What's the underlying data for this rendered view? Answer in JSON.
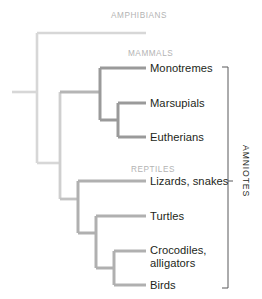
{
  "diagram": {
    "type": "cladogram",
    "title_visible": false,
    "colors": {
      "amphibian_branch": "#d7d7d7",
      "backbone_branch": "#c9c9c9",
      "mammal_branch": "#9a9a9a",
      "reptile_branch": "#b0b0b0",
      "group_label_color": "#b3b3b3",
      "tip_label_color": "#231f20",
      "bracket_color": "#58595b",
      "background": "#ffffff"
    },
    "group_labels": [
      {
        "name": "amphibians-group-label",
        "text": "AMPHIBIANS",
        "x": 111,
        "y": 11
      },
      {
        "name": "mammals-group-label",
        "text": "MAMMALS",
        "x": 128,
        "y": 49
      },
      {
        "name": "reptiles-group-label",
        "text": "REPTILES",
        "x": 131,
        "y": 165
      }
    ],
    "tips": [
      {
        "name": "tip-amphibians",
        "text": "",
        "x": 150,
        "y": 62,
        "branch_y": 33,
        "branch_x1": 37,
        "branch_x2": 146
      },
      {
        "name": "tip-monotremes",
        "text": "Monotremes",
        "x": 150,
        "y": 62,
        "branch_y": 68,
        "branch_x1": 100,
        "branch_x2": 146
      },
      {
        "name": "tip-marsupials",
        "text": "Marsupials",
        "x": 150,
        "y": 97,
        "branch_y": 103,
        "branch_x1": 118,
        "branch_x2": 146
      },
      {
        "name": "tip-eutherians",
        "text": "Eutherians",
        "x": 150,
        "y": 131,
        "branch_y": 137,
        "branch_x1": 118,
        "branch_x2": 146
      },
      {
        "name": "tip-lizards-snakes",
        "text": "Lizards, snakes",
        "x": 150,
        "y": 175,
        "branch_y": 181,
        "branch_x1": 78,
        "branch_x2": 146
      },
      {
        "name": "tip-turtles",
        "text": "Turtles",
        "x": 150,
        "y": 210,
        "branch_y": 216,
        "branch_x1": 96,
        "branch_x2": 146
      },
      {
        "name": "tip-crocodiles-alligators",
        "text": "Crocodiles,\nalligators",
        "x": 150,
        "y": 244,
        "branch_y": 251,
        "branch_x1": 114,
        "branch_x2": 146
      },
      {
        "name": "tip-birds",
        "text": "Birds",
        "x": 150,
        "y": 279,
        "branch_y": 285,
        "branch_x1": 114,
        "branch_x2": 146
      }
    ],
    "bracket": {
      "name": "amniotes-bracket",
      "label": "AMNIOTES",
      "x": 228,
      "y_top": 67,
      "y_bottom": 288,
      "tick_y": 181,
      "label_x": 243,
      "label_y": 145
    }
  }
}
